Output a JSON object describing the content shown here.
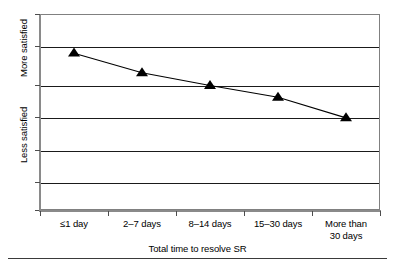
{
  "chart_data": {
    "type": "line",
    "title": "",
    "xlabel": "Total time to resolve SR",
    "ylabel": "",
    "categories": [
      "≤1 day",
      "2–7 days",
      "8–14 days",
      "15–30 days",
      "More than\n30 days"
    ],
    "series": [
      {
        "name": "Satisfaction",
        "values": [
          0.8,
          0.7,
          0.635,
          0.575,
          0.47
        ],
        "marker": "triangle",
        "marker_color": "#000000",
        "line_color": "#000000"
      }
    ],
    "y_axis": {
      "labels": [
        "More satisfied",
        "Less satisfied"
      ],
      "ticks_visible": true,
      "tick_labels": [],
      "ylim": [
        0,
        1
      ],
      "gridlines": [
        1.0,
        0.8,
        0.635,
        0.47,
        0.305,
        0.14,
        0.0
      ]
    },
    "grid": true,
    "legend": "none",
    "axis_frame_color": "#808080",
    "gridline_color": "#1a1a1a"
  },
  "axes": {
    "y_label_upper": "More satisfied",
    "y_label_lower": "Less satisfied",
    "x_title": "Total time to resolve SR"
  },
  "x_tick_labels": [
    "≤1 day",
    "2–7 days",
    "8–14 days",
    "15–30 days",
    "More than\n30 days"
  ]
}
